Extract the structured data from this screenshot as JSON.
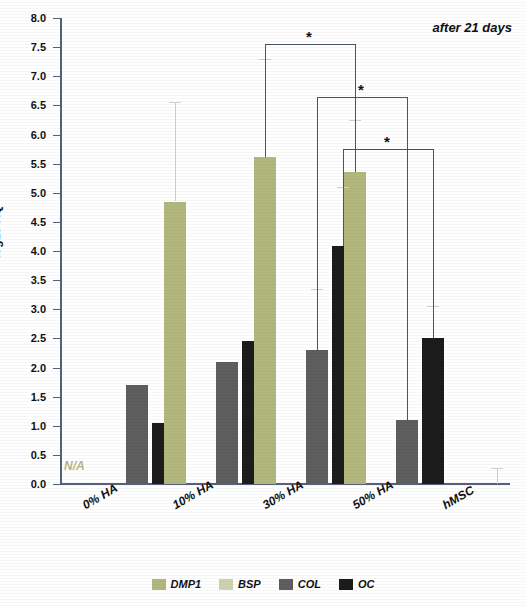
{
  "chart_data": {
    "type": "bar",
    "title": "after 21 days",
    "xlabel": "",
    "ylabel": "log10 RQ",
    "ylim": [
      0.0,
      8.0
    ],
    "ytick_step": 0.5,
    "yticks": [
      "0.0",
      "0.5",
      "1.0",
      "1.5",
      "2.0",
      "2.5",
      "3.0",
      "3.5",
      "4.0",
      "4.5",
      "5.0",
      "5.5",
      "6.0",
      "6.5",
      "7.0",
      "7.5",
      "8.0"
    ],
    "grid": false,
    "legend_position": "bottom-center",
    "categories": [
      "0% HA",
      "10% HA",
      "30% HA",
      "50% HA",
      "hMSC"
    ],
    "series": [
      {
        "name": "DMP1",
        "color": "#b2b87d",
        "values": [
          0.0,
          4.85,
          5.62,
          5.35,
          0.0
        ]
      },
      {
        "name": "BSP",
        "color": "#cfd2b0",
        "values": [
          0.0,
          0.0,
          0.0,
          0.0,
          0.0
        ]
      },
      {
        "name": "COL",
        "color": "#5e5e5e",
        "values": [
          1.7,
          2.1,
          2.3,
          1.1,
          0.0
        ]
      },
      {
        "name": "OC",
        "color": "#1c1c1c",
        "values": [
          1.05,
          2.45,
          4.08,
          2.5,
          0.0
        ]
      }
    ],
    "error_bars": [
      {
        "series": "DMP1",
        "category": "10% HA",
        "top": 6.55,
        "bottom": 4.85
      },
      {
        "series": "DMP1",
        "category": "30% HA",
        "top": 7.3,
        "bottom": 5.62
      },
      {
        "series": "COL",
        "category": "30% HA",
        "top": 3.35,
        "bottom": 2.3
      },
      {
        "series": "OC",
        "category": "30% HA",
        "top": 5.1,
        "bottom": 4.08
      },
      {
        "series": "DMP1",
        "category": "50% HA",
        "top": 6.25,
        "bottom": 5.35
      },
      {
        "series": "OC",
        "category": "50% HA",
        "top": 3.05,
        "bottom": 2.5
      },
      {
        "series": "COL",
        "category": "hMSC",
        "top": 0.28,
        "bottom": 0.0
      }
    ],
    "annotations": [
      {
        "label": "N/A",
        "category": "0% HA",
        "series": "DMP1"
      },
      {
        "label": "*",
        "type": "significance-bracket",
        "from": "30% HA DMP1",
        "to": "50% HA DMP1",
        "level": 7.55
      },
      {
        "label": "*",
        "type": "significance-bracket",
        "from": "30% HA COL",
        "to": "50% HA COL",
        "level": 6.65
      },
      {
        "label": "*",
        "type": "significance-bracket",
        "from": "30% HA OC",
        "to": "50% HA OC",
        "level": 5.75
      }
    ]
  },
  "legend": {
    "items": [
      {
        "label": "DMP1",
        "color": "#b2b87d"
      },
      {
        "label": "BSP",
        "color": "#cfd2b0"
      },
      {
        "label": "COL",
        "color": "#5e5e5e"
      },
      {
        "label": "OC",
        "color": "#1c1c1c"
      }
    ]
  },
  "labels": {
    "na": "N/A",
    "star": "*",
    "annotation_title": "after 21 days",
    "y_axis_title": "log10 RQ"
  }
}
